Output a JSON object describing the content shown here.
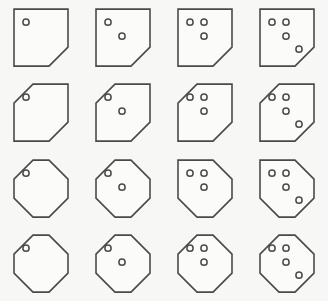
{
  "figure": {
    "name": "polygon-dot-matrix",
    "background_color": "#f7f7f5",
    "stroke_color": "#4a4a4a",
    "shape_fill_color": "#fbfbf9",
    "rows": 4,
    "columns": 4,
    "cell_width": 82,
    "cell_height": 75
  },
  "geometry": {
    "shape_box": {
      "x": 14,
      "y": 9,
      "width": 54,
      "height": 57
    },
    "corner_cut": 19,
    "dot_radius": 3.1,
    "dot_positions": [
      {
        "cx": 12,
        "cy": 13
      },
      {
        "cx": 26,
        "cy": 13
      },
      {
        "cx": 26,
        "cy": 27
      },
      {
        "cx": 39,
        "cy": 40
      }
    ],
    "dot_sequence_by_count": {
      "1": [
        0
      ],
      "2": [
        0,
        2
      ],
      "3": [
        0,
        1,
        2
      ],
      "4": [
        0,
        1,
        2,
        3
      ]
    }
  },
  "cells": [
    {
      "row": 0,
      "col": 0,
      "dots": 1,
      "cuts": [
        "bottom-right"
      ]
    },
    {
      "row": 0,
      "col": 1,
      "dots": 2,
      "cuts": [
        "bottom-right"
      ]
    },
    {
      "row": 0,
      "col": 2,
      "dots": 3,
      "cuts": [
        "bottom-right"
      ]
    },
    {
      "row": 0,
      "col": 3,
      "dots": 4,
      "cuts": [
        "bottom-right"
      ]
    },
    {
      "row": 1,
      "col": 0,
      "dots": 1,
      "cuts": [
        "top-left",
        "bottom-right"
      ]
    },
    {
      "row": 1,
      "col": 1,
      "dots": 2,
      "cuts": [
        "top-left",
        "bottom-right"
      ]
    },
    {
      "row": 1,
      "col": 2,
      "dots": 3,
      "cuts": [
        "top-left",
        "bottom-right"
      ]
    },
    {
      "row": 1,
      "col": 3,
      "dots": 4,
      "cuts": [
        "top-left",
        "bottom-right"
      ]
    },
    {
      "row": 2,
      "col": 0,
      "dots": 1,
      "cuts": [
        "top-left",
        "top-right",
        "bottom-right",
        "bottom-left"
      ]
    },
    {
      "row": 2,
      "col": 1,
      "dots": 2,
      "cuts": [
        "top-left",
        "top-right",
        "bottom-right",
        "bottom-left"
      ]
    },
    {
      "row": 2,
      "col": 2,
      "dots": 3,
      "cuts": [
        "top-right",
        "bottom-right",
        "bottom-left"
      ]
    },
    {
      "row": 2,
      "col": 3,
      "dots": 4,
      "cuts": [
        "top-right",
        "bottom-right",
        "bottom-left"
      ]
    },
    {
      "row": 3,
      "col": 0,
      "dots": 1,
      "cuts": [
        "top-left",
        "top-right",
        "bottom-right",
        "bottom-left"
      ]
    },
    {
      "row": 3,
      "col": 1,
      "dots": 2,
      "cuts": [
        "top-left",
        "top-right",
        "bottom-right",
        "bottom-left"
      ]
    },
    {
      "row": 3,
      "col": 2,
      "dots": 3,
      "cuts": [
        "top-left",
        "top-right",
        "bottom-right",
        "bottom-left"
      ]
    },
    {
      "row": 3,
      "col": 3,
      "dots": 4,
      "cuts": [
        "top-left",
        "top-right",
        "bottom-right",
        "bottom-left"
      ]
    }
  ]
}
